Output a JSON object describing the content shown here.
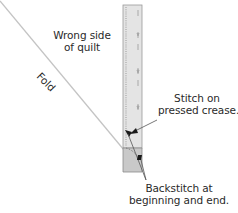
{
  "diagram": {
    "type": "quilt-binding-illustration",
    "labels": {
      "wrong_side": [
        "Wrong side",
        "of quilt"
      ],
      "fold": "Fold",
      "stitch": [
        "Stitch on",
        "pressed crease."
      ],
      "backstitch": [
        "Backstitch at",
        "beginning and end."
      ]
    },
    "colors": {
      "strip_light": "#e4e4e4",
      "strip_dark": "#c8c8c8",
      "strip_outline": "#9a9a9a",
      "fold_line": "#c4c4c4",
      "leader_line": "#555555",
      "arrowhead": "#1a1a1a",
      "text": "#2a2a2a"
    }
  }
}
